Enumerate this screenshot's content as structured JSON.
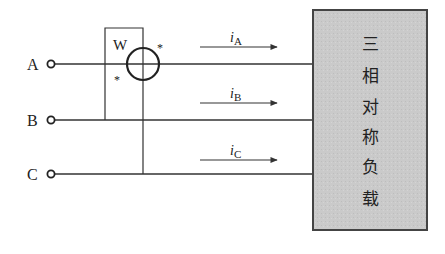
{
  "diagram": {
    "type": "three-phase wattmeter measurement circuit",
    "terminals": [
      {
        "label": "A",
        "y": 64
      },
      {
        "label": "B",
        "y": 120
      },
      {
        "label": "C",
        "y": 174
      }
    ],
    "wattmeter": {
      "label": "W",
      "polarity_marks": [
        "*",
        "*"
      ]
    },
    "currents": [
      {
        "symbol": "i",
        "subscript": "A"
      },
      {
        "symbol": "i",
        "subscript": "B"
      },
      {
        "symbol": "i",
        "subscript": "C"
      }
    ],
    "load": {
      "text_lines": [
        "三",
        "相",
        "对",
        "称",
        "负",
        "载"
      ],
      "fill": "#c8c8c8",
      "stroke": "#444444"
    },
    "line_color": "#333333"
  }
}
